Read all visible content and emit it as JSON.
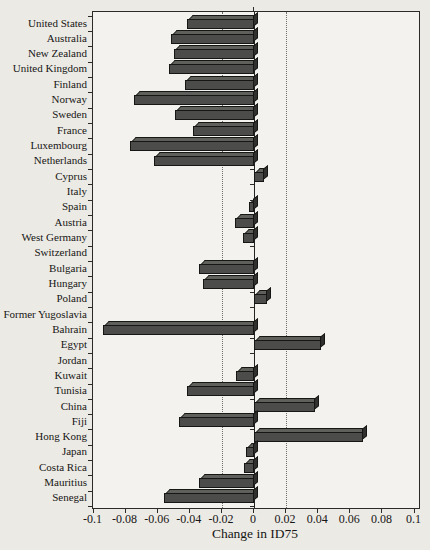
{
  "figure": {
    "kind": "scanned-bar-chart",
    "background": "#eceae5",
    "plot_background": "#f4f2ee"
  },
  "chart_data": {
    "type": "bar",
    "orientation": "horizontal",
    "title": "",
    "xlabel": "Change in ID75",
    "ylabel": "",
    "xlim": [
      -0.1,
      0.1
    ],
    "xticks": [
      -0.1,
      -0.08,
      -0.06,
      -0.04,
      -0.02,
      0,
      0.02,
      0.04,
      0.06,
      0.08,
      0.1
    ],
    "xtick_labels": [
      "-0.1",
      "-0.08",
      "-0.06",
      "-0.04",
      "-0.02",
      "0",
      "0.02",
      "0.04",
      "0.06",
      "0.08",
      "0.1"
    ],
    "gridlines_x": [
      -0.02,
      0.02
    ],
    "grid_style": "dotted",
    "legend": "none",
    "categories": [
      "United States",
      "Australia",
      "New Zealand",
      "United Kingdom",
      "Finland",
      "Norway",
      "Sweden",
      "France",
      "Luxembourg",
      "Netherlands",
      "Cyprus",
      "Italy",
      "Spain",
      "Austria",
      "West Germany",
      "Switzerland",
      "Bulgaria",
      "Hungary",
      "Poland",
      "Former Yugoslavia",
      "Bahrain",
      "Egypt",
      "Jordan",
      "Kuwait",
      "Tunisia",
      "China",
      "Fiji",
      "Hong Kong",
      "Japan",
      "Costa Rica",
      "Mauritius",
      "Senegal"
    ],
    "values": [
      -0.042,
      -0.052,
      -0.05,
      -0.053,
      -0.043,
      -0.075,
      -0.049,
      -0.038,
      -0.077,
      -0.062,
      0.006,
      0.0,
      -0.003,
      -0.012,
      -0.007,
      0.0,
      -0.034,
      -0.032,
      0.008,
      0.0,
      -0.094,
      0.042,
      0.0,
      -0.011,
      -0.042,
      0.038,
      -0.047,
      0.068,
      -0.005,
      -0.006,
      -0.034,
      -0.056
    ],
    "bar_colors": {
      "front": "#4c4c4a",
      "top": "#5f5f5b",
      "end": "#30302e",
      "outline": "#161614"
    }
  }
}
